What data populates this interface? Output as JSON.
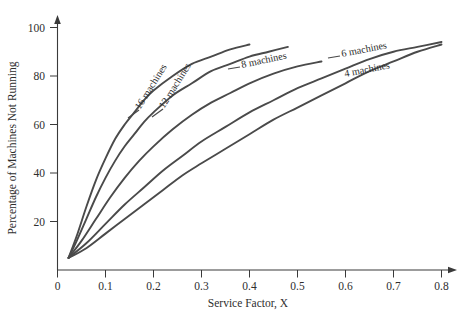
{
  "chart_data": {
    "type": "line",
    "title": "",
    "xlabel": "Service Factor, X",
    "ylabel": "Percentage of Machines Not Running",
    "xlim": [
      0,
      0.8
    ],
    "ylim": [
      0,
      100
    ],
    "xticks": [
      "0",
      "0.1",
      "0.2",
      "0.3",
      "0.4",
      "0.5",
      "0.6",
      "0.7",
      "0.8"
    ],
    "xtick_values": [
      0,
      0.1,
      0.2,
      0.3,
      0.4,
      0.5,
      0.6,
      0.7,
      0.8
    ],
    "yticks": [
      "20",
      "40",
      "60",
      "80",
      "100"
    ],
    "ytick_values": [
      20,
      40,
      60,
      80,
      100
    ],
    "grid": false,
    "legend_position": "inline-curve-labels",
    "series": [
      {
        "name": "16 machines",
        "label": "16 machines",
        "points": [
          [
            0.023,
            5
          ],
          [
            0.04,
            14
          ],
          [
            0.06,
            26
          ],
          [
            0.08,
            37
          ],
          [
            0.1,
            46
          ],
          [
            0.12,
            54
          ],
          [
            0.14,
            60
          ],
          [
            0.16,
            65
          ],
          [
            0.18,
            70
          ],
          [
            0.2,
            74
          ],
          [
            0.24,
            80
          ],
          [
            0.28,
            85
          ],
          [
            0.32,
            88
          ],
          [
            0.36,
            91
          ],
          [
            0.4,
            93
          ]
        ]
      },
      {
        "name": "12 machines",
        "label": "12 machines",
        "points": [
          [
            0.023,
            5
          ],
          [
            0.04,
            12
          ],
          [
            0.06,
            21
          ],
          [
            0.08,
            30
          ],
          [
            0.1,
            38
          ],
          [
            0.12,
            45
          ],
          [
            0.14,
            51
          ],
          [
            0.16,
            56
          ],
          [
            0.18,
            61
          ],
          [
            0.2,
            65
          ],
          [
            0.24,
            72
          ],
          [
            0.28,
            77
          ],
          [
            0.32,
            82
          ],
          [
            0.36,
            85
          ],
          [
            0.4,
            88
          ],
          [
            0.44,
            90
          ],
          [
            0.48,
            92
          ]
        ]
      },
      {
        "name": "8 machines",
        "label": "8 machines",
        "points": [
          [
            0.023,
            5
          ],
          [
            0.05,
            12
          ],
          [
            0.08,
            21
          ],
          [
            0.11,
            30
          ],
          [
            0.14,
            38
          ],
          [
            0.17,
            45
          ],
          [
            0.2,
            51
          ],
          [
            0.24,
            58
          ],
          [
            0.28,
            64
          ],
          [
            0.32,
            69
          ],
          [
            0.36,
            73
          ],
          [
            0.4,
            77
          ],
          [
            0.45,
            81
          ],
          [
            0.5,
            84
          ],
          [
            0.55,
            86
          ]
        ]
      },
      {
        "name": "6 machines",
        "label": "6 machines",
        "points": [
          [
            0.023,
            5
          ],
          [
            0.06,
            11
          ],
          [
            0.1,
            19
          ],
          [
            0.14,
            27
          ],
          [
            0.18,
            34
          ],
          [
            0.22,
            41
          ],
          [
            0.26,
            47
          ],
          [
            0.3,
            53
          ],
          [
            0.35,
            59
          ],
          [
            0.4,
            65
          ],
          [
            0.45,
            70
          ],
          [
            0.5,
            75
          ],
          [
            0.55,
            79
          ],
          [
            0.6,
            83
          ],
          [
            0.65,
            87
          ],
          [
            0.7,
            90
          ],
          [
            0.75,
            92
          ],
          [
            0.8,
            94
          ]
        ]
      },
      {
        "name": "4 machines",
        "label": "4 machines",
        "points": [
          [
            0.023,
            5
          ],
          [
            0.06,
            9
          ],
          [
            0.1,
            15
          ],
          [
            0.14,
            21
          ],
          [
            0.18,
            27
          ],
          [
            0.22,
            33
          ],
          [
            0.26,
            39
          ],
          [
            0.3,
            44
          ],
          [
            0.35,
            50
          ],
          [
            0.4,
            56
          ],
          [
            0.45,
            62
          ],
          [
            0.5,
            67
          ],
          [
            0.55,
            72
          ],
          [
            0.6,
            77
          ],
          [
            0.65,
            82
          ],
          [
            0.7,
            86
          ],
          [
            0.75,
            90
          ],
          [
            0.8,
            93
          ]
        ]
      }
    ]
  }
}
